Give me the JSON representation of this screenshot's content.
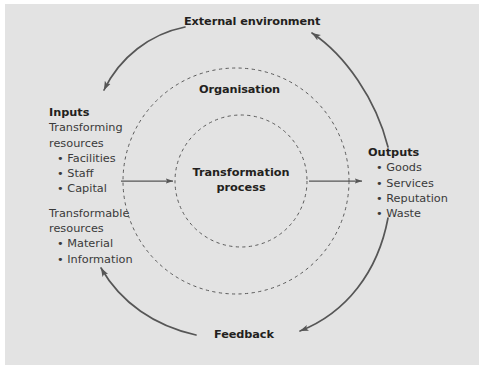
{
  "diagram": {
    "background_color": "#e3e3e3",
    "page_color": "#ffffff",
    "text_color": "#231f20",
    "body_text_color": "#3a3a3a",
    "arc_color": "#565656",
    "dashed_color": "#5a5a5a",
    "arrow_color": "#565656"
  },
  "labels": {
    "external_environment": "External environment",
    "organisation": "Organisation",
    "feedback": "Feedback",
    "transformation_process_line1": "Transformation",
    "transformation_process_line2": "process"
  },
  "inputs": {
    "heading": "Inputs",
    "group1_line1": "Transforming",
    "group1_line2": "resources",
    "group1_items": [
      "Facilities",
      "Staff",
      "Capital"
    ],
    "group2_line1": "Transformable",
    "group2_line2": "resources",
    "group2_items": [
      "Material",
      "Information"
    ]
  },
  "outputs": {
    "heading": "Outputs",
    "items": [
      "Goods",
      "Services",
      "Reputation",
      "Waste"
    ]
  },
  "icons": {
    "bullet": "•",
    "input_arrow": "arrow-right-icon",
    "output_arrow": "arrow-right-icon",
    "environment_arc_left": "arc-arrow-icon",
    "environment_arc_right": "arc-arrow-icon",
    "feedback_arc_left": "arc-arrow-icon",
    "feedback_arc_right": "arc-arrow-icon"
  }
}
